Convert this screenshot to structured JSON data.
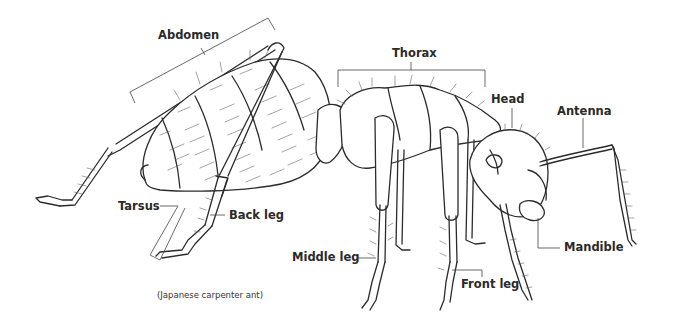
{
  "diagram": {
    "labels": {
      "abdomen": "Abdomen",
      "thorax": "Thorax",
      "head": "Head",
      "antenna": "Antenna",
      "tarsus": "Tarsus",
      "back_leg": "Back leg",
      "middle_leg": "Middle leg",
      "front_leg": "Front leg",
      "mandible": "Mandible"
    },
    "caption": "(Japanese carpenter ant)"
  }
}
